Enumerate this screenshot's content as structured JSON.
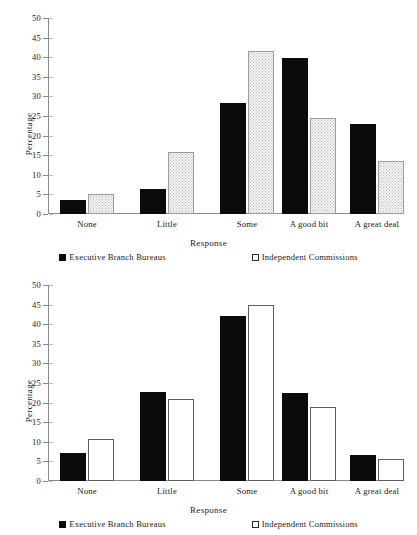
{
  "figure": {
    "series_names": [
      "Executive Branch Bureaus",
      "Independent Commissions"
    ],
    "legend": {
      "executive_label": "Executive Branch Bureaus",
      "independent_label": "Independent Commissions",
      "executive_swatch": "filled-square-icon",
      "independent_swatch": "open-square-icon"
    },
    "colors": {
      "executive_fill": "#0b0b0b",
      "independent_fill_top": "#f4f4f4",
      "independent_fill_bottom": "#ffffff",
      "axis": "#8a8a8a",
      "text": "#1a1a1a"
    }
  },
  "chart_data": [
    {
      "type": "bar",
      "title": "",
      "xlabel": "Response",
      "ylabel": "Percentage",
      "categories": [
        "None",
        "Little",
        "Some",
        "A good bit",
        "A great deal"
      ],
      "ylim": [
        0,
        50
      ],
      "yticks": [
        0,
        5,
        10,
        15,
        20,
        25,
        30,
        35,
        40,
        45,
        50
      ],
      "ytick_labels": [
        "0",
        "5",
        "10",
        "15",
        "20",
        "25",
        "30",
        "35",
        "40",
        "45",
        "50"
      ],
      "grid": false,
      "legend_position": "bottom",
      "series": [
        {
          "name": "Executive Branch Bureaus",
          "values": [
            3.6,
            6.4,
            28.4,
            39.8,
            23.0
          ]
        },
        {
          "name": "Independent Commissions",
          "values": [
            5.2,
            15.9,
            41.7,
            24.5,
            13.5
          ]
        }
      ]
    },
    {
      "type": "bar",
      "title": "",
      "xlabel": "Response",
      "ylabel": "Percentage",
      "categories": [
        "None",
        "Little",
        "Some",
        "A good bit",
        "A great deal"
      ],
      "ylim": [
        0,
        50
      ],
      "yticks": [
        0,
        5,
        10,
        15,
        20,
        25,
        30,
        35,
        40,
        45,
        50
      ],
      "ytick_labels": [
        "0",
        "5",
        "10",
        "15",
        "20",
        "25",
        "30",
        "35",
        "40",
        "45",
        "50"
      ],
      "grid": false,
      "legend_position": "bottom",
      "series": [
        {
          "name": "Executive Branch Bureaus",
          "values": [
            7.2,
            22.6,
            42.1,
            22.5,
            6.6
          ]
        },
        {
          "name": "Independent Commissions",
          "values": [
            10.7,
            20.9,
            45.0,
            19.0,
            5.7
          ]
        }
      ]
    }
  ]
}
